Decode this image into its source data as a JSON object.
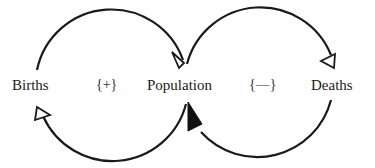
{
  "diagram": {
    "type": "causal-loop",
    "nodes": [
      {
        "id": "births",
        "label": "Births"
      },
      {
        "id": "population",
        "label": "Population"
      },
      {
        "id": "deaths",
        "label": "Deaths"
      }
    ],
    "loops": [
      {
        "id": "reinforcing",
        "polarity_label": "{+}"
      },
      {
        "id": "balancing",
        "polarity_label": "{—}"
      }
    ],
    "links": [
      {
        "from": "births",
        "to": "population",
        "arrowhead": "open"
      },
      {
        "from": "population",
        "to": "births",
        "arrowhead": "open"
      },
      {
        "from": "population",
        "to": "deaths",
        "arrowhead": "open"
      },
      {
        "from": "deaths",
        "to": "population",
        "arrowhead": "filled"
      }
    ],
    "colors": {
      "stroke": "#1a1a1a",
      "text": "#1a1a1a",
      "background": "#ffffff"
    }
  }
}
